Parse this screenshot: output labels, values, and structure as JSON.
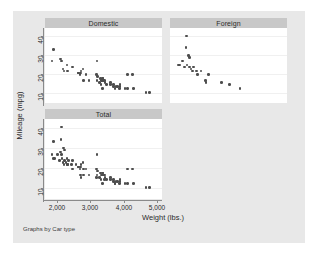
{
  "graph": {
    "note": "Graphs by Car type",
    "y_axis_title": "Mileage (mpg)",
    "x_axis_title": "Weight (lbs.)",
    "background_color": "#e8e8e8",
    "panel_header_color": "#c8c8c8",
    "marker_color": "#4d4d4d",
    "plot_background_color": "#ffffff"
  },
  "chart_data": {
    "type": "scatter",
    "title": "",
    "xlabel": "Weight (lbs.)",
    "ylabel": "Mileage (mpg)",
    "note": "Graphs by Car type",
    "grid": true,
    "legend": "none",
    "xlim": [
      1600,
      5100
    ],
    "ylim": [
      8,
      43
    ],
    "xticks": [
      2000,
      3000,
      4000,
      5000
    ],
    "xtick_labels": [
      "2,000",
      "3,000",
      "4,000",
      "5,000"
    ],
    "yticks": [
      10,
      20,
      30,
      40
    ],
    "ytick_labels": [
      "10",
      "20",
      "30",
      "40"
    ],
    "panels": [
      {
        "label": "Domestic",
        "row": 0,
        "col": 0,
        "n": 52,
        "points": [
          [
            1800,
            34
          ],
          [
            1760,
            28
          ],
          [
            2020,
            29
          ],
          [
            2050,
            28
          ],
          [
            2230,
            26
          ],
          [
            2110,
            24
          ],
          [
            2130,
            23
          ],
          [
            2240,
            23
          ],
          [
            2410,
            25
          ],
          [
            2580,
            22
          ],
          [
            2670,
            23
          ],
          [
            2650,
            22
          ],
          [
            2600,
            22
          ],
          [
            2640,
            21
          ],
          [
            2730,
            24
          ],
          [
            2830,
            21
          ],
          [
            2750,
            18
          ],
          [
            2930,
            18
          ],
          [
            3180,
            28
          ],
          [
            3170,
            21
          ],
          [
            3200,
            20
          ],
          [
            3280,
            19
          ],
          [
            3310,
            18
          ],
          [
            3350,
            19
          ],
          [
            3330,
            18
          ],
          [
            3350,
            18
          ],
          [
            3370,
            19
          ],
          [
            3400,
            18
          ],
          [
            3420,
            18
          ],
          [
            3180,
            18
          ],
          [
            3260,
            17
          ],
          [
            3300,
            16
          ],
          [
            3430,
            17
          ],
          [
            3470,
            16
          ],
          [
            3600,
            17
          ],
          [
            3600,
            16
          ],
          [
            3690,
            16
          ],
          [
            3700,
            15
          ],
          [
            3740,
            14
          ],
          [
            3780,
            15
          ],
          [
            3830,
            15
          ],
          [
            3900,
            16
          ],
          [
            3880,
            14
          ],
          [
            3900,
            15
          ],
          [
            4060,
            14
          ],
          [
            4130,
            21
          ],
          [
            4130,
            14
          ],
          [
            4290,
            21
          ],
          [
            4330,
            14
          ],
          [
            4720,
            12
          ],
          [
            4840,
            12
          ],
          [
            3350,
            14
          ]
        ]
      },
      {
        "label": "Foreign",
        "row": 0,
        "col": 1,
        "n": 22,
        "points": [
          [
            2050,
            41
          ],
          [
            2040,
            35
          ],
          [
            2120,
            31
          ],
          [
            2160,
            30
          ],
          [
            1930,
            28
          ],
          [
            1800,
            26
          ],
          [
            1830,
            26
          ],
          [
            1990,
            25
          ],
          [
            2070,
            26
          ],
          [
            2150,
            25
          ],
          [
            2200,
            24
          ],
          [
            2240,
            23
          ],
          [
            2280,
            25
          ],
          [
            2370,
            23
          ],
          [
            2410,
            21
          ],
          [
            2520,
            23
          ],
          [
            2650,
            18
          ],
          [
            2670,
            17
          ],
          [
            2750,
            21
          ],
          [
            3170,
            17
          ],
          [
            3420,
            16
          ],
          [
            3740,
            14
          ]
        ]
      },
      {
        "label": "Total",
        "row": 1,
        "col": 0,
        "n": 74,
        "points": [
          [
            2050,
            41
          ],
          [
            1800,
            34
          ],
          [
            2040,
            35
          ],
          [
            1760,
            28
          ],
          [
            2020,
            29
          ],
          [
            2050,
            28
          ],
          [
            2120,
            31
          ],
          [
            2160,
            30
          ],
          [
            1930,
            28
          ],
          [
            1800,
            26
          ],
          [
            1830,
            26
          ],
          [
            1990,
            25
          ],
          [
            2070,
            26
          ],
          [
            2150,
            25
          ],
          [
            2200,
            24
          ],
          [
            2230,
            26
          ],
          [
            2110,
            24
          ],
          [
            2130,
            23
          ],
          [
            2240,
            23
          ],
          [
            2240,
            23
          ],
          [
            2280,
            25
          ],
          [
            2370,
            23
          ],
          [
            2410,
            25
          ],
          [
            2410,
            21
          ],
          [
            2520,
            23
          ],
          [
            2580,
            22
          ],
          [
            2600,
            22
          ],
          [
            2640,
            21
          ],
          [
            2650,
            22
          ],
          [
            2650,
            18
          ],
          [
            2670,
            23
          ],
          [
            2670,
            17
          ],
          [
            2730,
            24
          ],
          [
            2750,
            21
          ],
          [
            2750,
            18
          ],
          [
            2830,
            21
          ],
          [
            2930,
            18
          ],
          [
            3170,
            21
          ],
          [
            3170,
            17
          ],
          [
            3180,
            28
          ],
          [
            3180,
            18
          ],
          [
            3200,
            20
          ],
          [
            3260,
            17
          ],
          [
            3280,
            19
          ],
          [
            3300,
            16
          ],
          [
            3310,
            18
          ],
          [
            3330,
            18
          ],
          [
            3350,
            19
          ],
          [
            3350,
            18
          ],
          [
            3350,
            14
          ],
          [
            3370,
            19
          ],
          [
            3400,
            18
          ],
          [
            3420,
            18
          ],
          [
            3420,
            16
          ],
          [
            3430,
            17
          ],
          [
            3470,
            16
          ],
          [
            3600,
            17
          ],
          [
            3600,
            16
          ],
          [
            3690,
            16
          ],
          [
            3700,
            15
          ],
          [
            3740,
            14
          ],
          [
            3740,
            14
          ],
          [
            3780,
            15
          ],
          [
            3830,
            15
          ],
          [
            3880,
            14
          ],
          [
            3900,
            16
          ],
          [
            3900,
            15
          ],
          [
            4060,
            14
          ],
          [
            4130,
            21
          ],
          [
            4130,
            14
          ],
          [
            4290,
            21
          ],
          [
            4330,
            14
          ],
          [
            4720,
            12
          ],
          [
            4840,
            12
          ]
        ]
      }
    ]
  }
}
